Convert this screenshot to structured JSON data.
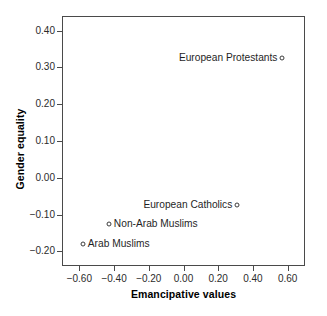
{
  "chart_data": {
    "type": "scatter",
    "title": "",
    "xlabel": "Emancipative values",
    "ylabel": "Gender equality",
    "xlim": [
      -0.7,
      0.7
    ],
    "ylim": [
      -0.24,
      0.44
    ],
    "xticks": [
      "-0.60",
      "-0.40",
      "-0.20",
      "0.00",
      "0.20",
      "0.40",
      "0.60"
    ],
    "xtick_values": [
      -0.6,
      -0.4,
      -0.2,
      0.0,
      0.2,
      0.4,
      0.6
    ],
    "yticks": [
      "0.40",
      "0.30",
      "0.20",
      "0.10",
      "0.00",
      "-0.10",
      "-0.20"
    ],
    "ytick_values": [
      0.4,
      0.3,
      0.2,
      0.1,
      0.0,
      -0.1,
      -0.2
    ],
    "grid": false,
    "legend": null,
    "marker": "open-circle",
    "points": [
      {
        "label": "European Protestants",
        "x": 0.57,
        "y": 0.325,
        "label_side": "left"
      },
      {
        "label": "European Catholics",
        "x": 0.31,
        "y": -0.075,
        "label_side": "left"
      },
      {
        "label": "Non-Arab Muslims",
        "x": -0.43,
        "y": -0.125,
        "label_side": "right"
      },
      {
        "label": "Arab Muslims",
        "x": -0.58,
        "y": -0.18,
        "label_side": "right"
      }
    ],
    "colors": {
      "axis": "#4a4a4a",
      "marker": "#3c3c3c",
      "text": "#1f1f1f",
      "background": "#ffffff"
    }
  }
}
